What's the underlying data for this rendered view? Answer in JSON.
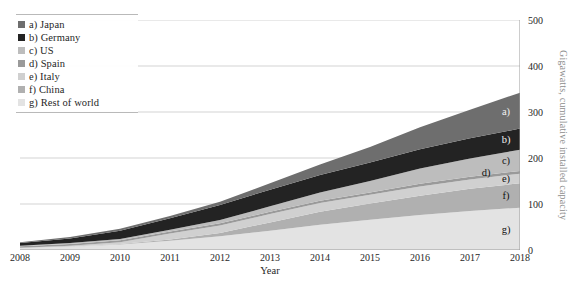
{
  "chart_data": {
    "type": "area",
    "stacked": true,
    "title": "",
    "xlabel": "Year",
    "ylabel": "Gigawatts, cumulative installed capacity",
    "x": [
      2008,
      2009,
      2010,
      2011,
      2012,
      2013,
      2014,
      2015,
      2016,
      2017,
      2018
    ],
    "categories": [
      "2008",
      "2009",
      "2010",
      "2011",
      "2012",
      "2013",
      "2014",
      "2015",
      "2016",
      "2017",
      "2018"
    ],
    "xlim": [
      2008,
      2018
    ],
    "ylim": [
      0,
      500
    ],
    "yticks": [
      0,
      100,
      200,
      300,
      400,
      500
    ],
    "ytick_labels": [
      "0",
      "100",
      "200",
      "300",
      "400",
      "500"
    ],
    "grid": true,
    "grid_axis": "y",
    "legend_position": "top-left",
    "y_axis_side": "right",
    "series": [
      {
        "key": "g",
        "name": "g) Rest of world",
        "legend": "g) Rest of world",
        "color": "#e3e3e3",
        "values": [
          4,
          7,
          12,
          20,
          30,
          42,
          55,
          66,
          76,
          85,
          92
        ]
      },
      {
        "key": "f",
        "name": "f) China",
        "legend": "f) China",
        "color": "#b0b0b0",
        "values": [
          0,
          0,
          1,
          3,
          7,
          18,
          28,
          35,
          42,
          48,
          53
        ]
      },
      {
        "key": "e",
        "name": "e) Italy",
        "legend": "e) Italy",
        "color": "#d0d0d0",
        "values": [
          1,
          2,
          4,
          13,
          16,
          18,
          19,
          19,
          20,
          20,
          21
        ]
      },
      {
        "key": "d",
        "name": "d) Spain",
        "legend": "d) Spain",
        "color": "#9a9a9a",
        "values": [
          3,
          4,
          4,
          4,
          5,
          5,
          5,
          5,
          6,
          6,
          6
        ]
      },
      {
        "key": "c",
        "name": "c) US",
        "legend": "c) US",
        "color": "#bdbdbd",
        "values": [
          1,
          2,
          3,
          4,
          7,
          12,
          18,
          25,
          33,
          40,
          46
        ]
      },
      {
        "key": "b",
        "name": "b) Germany",
        "legend": "b) Germany",
        "color": "#232323",
        "values": [
          6,
          10,
          18,
          25,
          33,
          36,
          38,
          40,
          42,
          44,
          46
        ]
      },
      {
        "key": "a",
        "name": "a) Japan",
        "legend": "a) Japan",
        "color": "#6e6e6e",
        "values": [
          2,
          3,
          4,
          5,
          7,
          14,
          23,
          34,
          48,
          62,
          78
        ]
      }
    ],
    "totals": [
      17,
      28,
      46,
      74,
      105,
      145,
      186,
      224,
      267,
      305,
      342
    ],
    "band_labels": [
      {
        "key": "a",
        "text": "a)"
      },
      {
        "key": "b",
        "text": "b)"
      },
      {
        "key": "c",
        "text": "c)"
      },
      {
        "key": "d",
        "text": "d)"
      },
      {
        "key": "e",
        "text": "e)"
      },
      {
        "key": "f",
        "text": "f)"
      },
      {
        "key": "g",
        "text": "g)"
      }
    ]
  },
  "legend": {
    "items": [
      {
        "label": "a) Japan",
        "color": "#6e6e6e"
      },
      {
        "label": "b) Germany",
        "color": "#232323"
      },
      {
        "label": "c) US",
        "color": "#bdbdbd"
      },
      {
        "label": "d) Spain",
        "color": "#9a9a9a"
      },
      {
        "label": "e) Italy",
        "color": "#d0d0d0"
      },
      {
        "label": "f) China",
        "color": "#b0b0b0"
      },
      {
        "label": "g) Rest of world",
        "color": "#e3e3e3"
      }
    ]
  },
  "axes": {
    "x_title": "Year",
    "y_title": "Gigawatts, cumulative installed capacity",
    "x_tick_labels": [
      "2008",
      "2009",
      "2010",
      "2011",
      "2012",
      "2013",
      "2014",
      "2015",
      "2016",
      "2017",
      "2018"
    ],
    "y_tick_labels": [
      "0",
      "100",
      "200",
      "300",
      "400",
      "500"
    ]
  },
  "colors": {
    "gridline": "#c8c8c8",
    "axis_line": "#9a9a9a",
    "text": "#1f1f1f",
    "y_title_text": "#8d8d8d",
    "background": "#ffffff"
  }
}
